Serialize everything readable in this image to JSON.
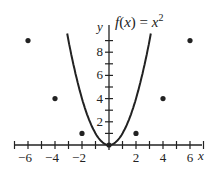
{
  "chart_data": {
    "type": "line",
    "title_parts": {
      "lhs": "f(x) = x",
      "sup": "2"
    },
    "xlabel": "x",
    "ylabel": "y",
    "xlim": [
      -7.5,
      7.3
    ],
    "ylim": [
      0,
      9.5
    ],
    "x_ticks": [
      -6,
      -4,
      -2,
      2,
      4,
      6
    ],
    "x_tick_labels": [
      "−6",
      "−4",
      "−2",
      "2",
      "4",
      "6"
    ],
    "y_ticks": [
      2,
      4,
      6,
      8
    ],
    "y_tick_labels": [
      "2",
      "4",
      "6",
      "8"
    ],
    "minor_tick_step": 1,
    "grid": false,
    "series": [
      {
        "name": "f(x) = x^2",
        "kind": "curve",
        "function": "x^2",
        "x_range": [
          -3.1,
          3.1
        ]
      },
      {
        "name": "points",
        "kind": "scatter",
        "x": [
          -6,
          -4,
          -2,
          0,
          2,
          4,
          6
        ],
        "y": [
          9,
          4,
          1,
          0,
          1,
          4,
          9
        ]
      }
    ]
  },
  "colors": {
    "ink": "#222222",
    "background": "#ffffff"
  }
}
